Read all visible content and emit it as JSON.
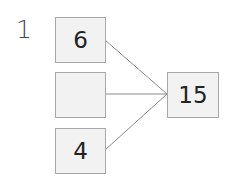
{
  "question_number": "1",
  "diagram": {
    "parts": [
      {
        "value": "6"
      },
      {
        "value": ""
      },
      {
        "value": "4"
      }
    ],
    "whole": {
      "value": "15"
    },
    "line_color": "#8a8a8a",
    "box_fill": "#f2f2f2"
  }
}
